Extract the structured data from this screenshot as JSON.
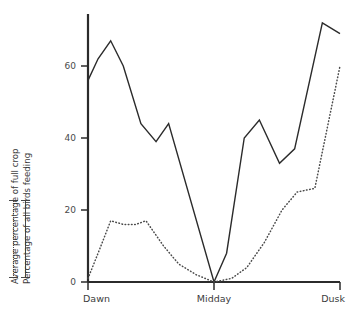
{
  "chart_data": {
    "type": "line",
    "title": "",
    "xlabel": "",
    "ylabel": "",
    "grid": false,
    "legend_position": "left-rotated",
    "x": [
      "Dawn",
      "Midday",
      "Dusk"
    ],
    "xtick_labels": [
      "Dawn",
      "Midday",
      "Dusk"
    ],
    "xtick_positions": [
      0,
      50,
      100
    ],
    "ytick_labels": [
      "0",
      "20",
      "40",
      "60"
    ],
    "ytick_values": [
      0,
      20,
      40,
      60
    ],
    "ylim": [
      0,
      78
    ],
    "xlim": [
      0,
      100
    ],
    "series": [
      {
        "name": "Percentage of all birds feeding",
        "style": "solid",
        "color": "#2b2b2b",
        "points": [
          {
            "x": 0,
            "y": 56
          },
          {
            "x": 4,
            "y": 62
          },
          {
            "x": 9,
            "y": 67
          },
          {
            "x": 14,
            "y": 60
          },
          {
            "x": 21,
            "y": 44
          },
          {
            "x": 27,
            "y": 39
          },
          {
            "x": 32,
            "y": 44
          },
          {
            "x": 50,
            "y": 0
          },
          {
            "x": 55,
            "y": 8
          },
          {
            "x": 62,
            "y": 40
          },
          {
            "x": 68,
            "y": 45
          },
          {
            "x": 76,
            "y": 33
          },
          {
            "x": 82,
            "y": 37
          },
          {
            "x": 93,
            "y": 72
          },
          {
            "x": 100,
            "y": 69
          }
        ]
      },
      {
        "name": "Average percentage of full crop",
        "style": "dotted",
        "color": "#4a4a4a",
        "points": [
          {
            "x": 0,
            "y": 1
          },
          {
            "x": 4,
            "y": 8
          },
          {
            "x": 9,
            "y": 17
          },
          {
            "x": 14,
            "y": 16
          },
          {
            "x": 19,
            "y": 16
          },
          {
            "x": 23,
            "y": 17
          },
          {
            "x": 30,
            "y": 10
          },
          {
            "x": 36,
            "y": 5
          },
          {
            "x": 43,
            "y": 2
          },
          {
            "x": 50,
            "y": 0
          },
          {
            "x": 57,
            "y": 1
          },
          {
            "x": 63,
            "y": 4
          },
          {
            "x": 70,
            "y": 11
          },
          {
            "x": 77,
            "y": 20
          },
          {
            "x": 83,
            "y": 25
          },
          {
            "x": 90,
            "y": 26
          },
          {
            "x": 100,
            "y": 60
          }
        ]
      }
    ]
  },
  "legend": {
    "entry_dotted": "Average percentage of full crop",
    "entry_solid": "Percentage of all birds feeding"
  }
}
